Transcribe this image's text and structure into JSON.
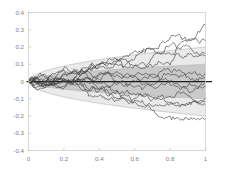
{
  "chart_data": {
    "type": "line",
    "title": "",
    "subtitle": "",
    "xlabel": "",
    "ylabel": "",
    "xlim": [
      0,
      1
    ],
    "ylim": [
      -0.4,
      0.4
    ],
    "xticks": [
      0,
      0.2,
      0.4,
      0.6,
      0.8,
      1
    ],
    "xtick_labels": [
      "0",
      "0.2",
      "0.4",
      "0.6",
      "0.8",
      "1"
    ],
    "yticks": [
      0.4,
      0.3,
      0.2,
      0.1,
      0,
      -0.1,
      -0.2,
      -0.3,
      -0.4
    ],
    "ytick_labels": [
      "0.4",
      "0.3",
      "0.2",
      "0.1",
      "0",
      "-0.1",
      "-0.2",
      "-0.3",
      "-0.4"
    ],
    "grid": false,
    "legend": null,
    "legend_position": "none",
    "annotations": [],
    "reference_lines": [
      {
        "name": "zero-line",
        "orientation": "horizontal",
        "value": 0,
        "color": "#1a1a1a",
        "width": 1.25
      }
    ],
    "bands": [
      {
        "name": "outer-envelope",
        "label": "outer envelope",
        "sigma_multiple": 2,
        "sigma": 0.1,
        "shape": "sqrt",
        "value_at_t1": 0.2,
        "fill": "#eaeaea",
        "edge": "#b4b4b4"
      },
      {
        "name": "inner-envelope",
        "label": "inner envelope",
        "sigma_multiple": 1,
        "sigma": 0.1,
        "shape": "sqrt",
        "value_at_t1": 0.1,
        "fill": "#c9c9c9",
        "edge": "#b4b4b4"
      }
    ],
    "series_color": "#3c3c3c",
    "series_width": 0.62,
    "n_series": 12,
    "n_steps": 120,
    "x": [
      0,
      0.00833,
      0.01667,
      0.025,
      0.03333,
      0.04167,
      0.05,
      0.05833,
      0.06667,
      0.075,
      0.08333,
      0.09167,
      0.1,
      0.10833,
      0.11667,
      0.125,
      0.13333,
      0.14167,
      0.15,
      0.15833,
      0.16667,
      0.175,
      0.18333,
      0.19167,
      0.2,
      0.20833,
      0.21667,
      0.225,
      0.23333,
      0.24167,
      0.25,
      0.25833,
      0.26667,
      0.275,
      0.28333,
      0.29167,
      0.3,
      0.30833,
      0.31667,
      0.325,
      0.33333,
      0.34167,
      0.35,
      0.35833,
      0.36667,
      0.375,
      0.38333,
      0.39167,
      0.4,
      0.40833,
      0.41667,
      0.425,
      0.43333,
      0.44167,
      0.45,
      0.45833,
      0.46667,
      0.475,
      0.48333,
      0.49167,
      0.5,
      0.50833,
      0.51667,
      0.525,
      0.53333,
      0.54167,
      0.55,
      0.55833,
      0.56667,
      0.575,
      0.58333,
      0.59167,
      0.6,
      0.60833,
      0.61667,
      0.625,
      0.63333,
      0.64167,
      0.65,
      0.65833,
      0.66667,
      0.675,
      0.68333,
      0.69167,
      0.7,
      0.70833,
      0.71667,
      0.725,
      0.73333,
      0.74167,
      0.75,
      0.75833,
      0.76667,
      0.775,
      0.78333,
      0.79167,
      0.8,
      0.80833,
      0.81667,
      0.825,
      0.83333,
      0.84167,
      0.85,
      0.85833,
      0.86667,
      0.875,
      0.88333,
      0.89167,
      0.9,
      0.90833,
      0.91667,
      0.925,
      0.93333,
      0.94167,
      0.95,
      0.95833,
      0.96667,
      0.975,
      0.98333,
      0.99167,
      1
    ],
    "series": [
      {
        "name": "path-1",
        "endpoint": 0.327,
        "min": -0.01,
        "max": 0.327
      },
      {
        "name": "path-2",
        "endpoint": 0.238,
        "min": -0.04,
        "max": 0.243
      },
      {
        "name": "path-3",
        "endpoint": 0.16,
        "min": -0.075,
        "max": 0.205
      },
      {
        "name": "path-4",
        "endpoint": 0.148,
        "min": -0.06,
        "max": 0.17
      },
      {
        "name": "path-5",
        "endpoint": 0.052,
        "min": -0.055,
        "max": 0.12
      },
      {
        "name": "path-6",
        "endpoint": 0.02,
        "min": -0.065,
        "max": 0.1
      },
      {
        "name": "path-7",
        "endpoint": -0.008,
        "min": -0.085,
        "max": 0.075
      },
      {
        "name": "path-8",
        "endpoint": -0.03,
        "min": -0.095,
        "max": 0.06
      },
      {
        "name": "path-9",
        "endpoint": -0.095,
        "min": -0.16,
        "max": 0.045
      },
      {
        "name": "path-10",
        "endpoint": -0.118,
        "min": -0.2,
        "max": 0.03
      },
      {
        "name": "path-11",
        "endpoint": -0.135,
        "min": -0.235,
        "max": 0.02
      },
      {
        "name": "path-12",
        "endpoint": -0.222,
        "min": -0.315,
        "max": 0.015
      }
    ]
  }
}
